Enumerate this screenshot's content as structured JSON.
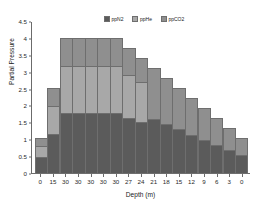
{
  "chart_data": {
    "type": "bar",
    "stacked": true,
    "title": "",
    "xlabel": "Depth (m)",
    "ylabel": "Partial Pressure",
    "categories": [
      "0",
      "15",
      "30",
      "30",
      "30",
      "30",
      "30",
      "27",
      "24",
      "21",
      "18",
      "15",
      "12",
      "9",
      "6",
      "3",
      "0"
    ],
    "ylim": [
      0,
      4.5
    ],
    "yticks": [
      "0",
      "0.5",
      "1",
      "1.5",
      "2",
      "2.5",
      "3",
      "3.5",
      "4",
      "4.5"
    ],
    "ytick_values": [
      0,
      0.5,
      1,
      1.5,
      2,
      2.5,
      3,
      3.5,
      4,
      4.5
    ],
    "grid": false,
    "legend_position": "top-center",
    "series": [
      {
        "name": "ppN2",
        "color": "#5b5b5b",
        "values": [
          0.45,
          1.12,
          1.77,
          1.77,
          1.77,
          1.77,
          1.77,
          1.62,
          1.5,
          1.57,
          1.42,
          1.27,
          1.1,
          0.96,
          0.8,
          0.65,
          0.51
        ]
      },
      {
        "name": "ppHe",
        "color": "#a8a8a8",
        "values": [
          0.33,
          0.86,
          1.38,
          1.38,
          1.38,
          1.38,
          1.38,
          1.28,
          1.18,
          0.0,
          0.0,
          0.0,
          0.0,
          0.0,
          0.0,
          0.0,
          0.0
        ]
      },
      {
        "name": "ppCO2",
        "color": "#8f8f8f",
        "values": [
          0.22,
          0.52,
          0.85,
          0.85,
          0.85,
          0.85,
          0.85,
          0.8,
          0.72,
          1.53,
          1.38,
          1.23,
          1.1,
          0.94,
          0.8,
          0.65,
          0.49
        ]
      }
    ],
    "totals": [
      1.0,
      2.5,
      4.0,
      4.0,
      4.0,
      4.0,
      4.0,
      3.7,
      3.4,
      3.1,
      2.8,
      2.5,
      2.2,
      1.9,
      1.6,
      1.3,
      1.0
    ]
  },
  "legend": {
    "items": [
      {
        "label": "ppN2"
      },
      {
        "label": "ppHe"
      },
      {
        "label": "ppCO2"
      }
    ]
  }
}
